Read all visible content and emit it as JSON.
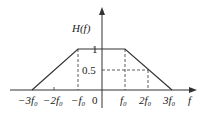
{
  "diagram": {
    "type": "frequency-response",
    "y_axis_label": "H(f)",
    "x_axis_label": "f",
    "y_ticks": [
      {
        "label": "1",
        "value": 1
      },
      {
        "label": "0.5",
        "value": 0.5
      }
    ],
    "x_ticks": [
      {
        "label": "−3f₀",
        "value": -3
      },
      {
        "label": "−2f₀",
        "value": -2
      },
      {
        "label": "−f₀",
        "value": -1
      },
      {
        "label": "0",
        "value": 0
      },
      {
        "label": "f₀",
        "value": 1
      },
      {
        "label": "2f₀",
        "value": 2
      },
      {
        "label": "3f₀",
        "value": 3
      }
    ],
    "curve_points": [
      [
        -3,
        0
      ],
      [
        -1,
        1
      ],
      [
        1,
        1
      ],
      [
        3,
        0
      ]
    ],
    "dashed_guides": [
      {
        "from": [
          -1,
          0
        ],
        "to": [
          -1,
          1
        ]
      },
      {
        "from": [
          1,
          0
        ],
        "to": [
          1,
          1
        ]
      },
      {
        "from": [
          2,
          0
        ],
        "to": [
          2,
          0.5
        ]
      },
      {
        "from": [
          0,
          0.5
        ],
        "to": [
          2,
          0.5
        ]
      }
    ],
    "colors": {
      "line": "#333333",
      "background": "#ffffff"
    }
  }
}
